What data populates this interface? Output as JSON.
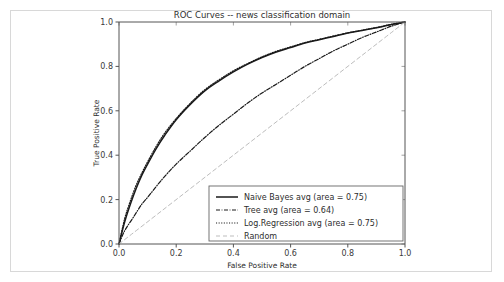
{
  "chart_data": {
    "type": "line",
    "title": "ROC Curves -- news classification domain",
    "xlabel": "False Positive Rate",
    "ylabel": "True Positive Rate",
    "xlim": [
      0.0,
      1.0
    ],
    "ylim": [
      0.0,
      1.0
    ],
    "grid": false,
    "legend_position": "lower right",
    "xticks": [
      "0.0",
      "0.2",
      "0.4",
      "0.6",
      "0.8",
      "1.0"
    ],
    "xtick_values": [
      0.0,
      0.2,
      0.4,
      0.6,
      0.8,
      1.0
    ],
    "yticks": [
      "0.0",
      "0.2",
      "0.4",
      "0.6",
      "0.8",
      "1.0"
    ],
    "ytick_values": [
      0.0,
      0.2,
      0.4,
      0.6,
      0.8,
      1.0
    ],
    "series": [
      {
        "name": "Naive Bayes avg (area = 0.75)",
        "label": "Naive Bayes avg (area = 0.75)",
        "area": 0.75,
        "style": "solid",
        "color": "#1a1a1a",
        "x": [
          0.0,
          0.02,
          0.04,
          0.06,
          0.08,
          0.1,
          0.13,
          0.16,
          0.2,
          0.25,
          0.3,
          0.35,
          0.4,
          0.45,
          0.5,
          0.55,
          0.6,
          0.65,
          0.7,
          0.75,
          0.8,
          0.85,
          0.9,
          0.95,
          1.0
        ],
        "y": [
          0.0,
          0.1,
          0.18,
          0.25,
          0.31,
          0.36,
          0.43,
          0.49,
          0.56,
          0.63,
          0.69,
          0.735,
          0.775,
          0.81,
          0.84,
          0.865,
          0.885,
          0.905,
          0.92,
          0.935,
          0.95,
          0.962,
          0.974,
          0.988,
          1.0
        ]
      },
      {
        "name": "Tree avg (area = 0.64)",
        "label": "Tree avg (area = 0.64)",
        "area": 0.64,
        "style": "dashdot",
        "color": "#1a1a1a",
        "x": [
          0.0,
          0.02,
          0.05,
          0.08,
          0.1,
          0.15,
          0.2,
          0.25,
          0.3,
          0.35,
          0.4,
          0.45,
          0.5,
          0.55,
          0.6,
          0.65,
          0.7,
          0.75,
          0.8,
          0.85,
          0.9,
          0.95,
          1.0
        ],
        "y": [
          0.0,
          0.06,
          0.12,
          0.18,
          0.21,
          0.29,
          0.36,
          0.42,
          0.48,
          0.535,
          0.585,
          0.635,
          0.68,
          0.72,
          0.76,
          0.8,
          0.835,
          0.87,
          0.9,
          0.93,
          0.955,
          0.98,
          1.0
        ]
      },
      {
        "name": "Log.Regression avg (area = 0.75)",
        "label": "Log.Regression avg (area = 0.75)",
        "area": 0.75,
        "style": "dotted-marker",
        "color": "#1a1a1a",
        "x": [
          0.0,
          0.02,
          0.04,
          0.06,
          0.08,
          0.1,
          0.13,
          0.16,
          0.2,
          0.25,
          0.3,
          0.35,
          0.4,
          0.45,
          0.5,
          0.55,
          0.6,
          0.65,
          0.7,
          0.75,
          0.8,
          0.85,
          0.9,
          0.95,
          1.0
        ],
        "y": [
          0.0,
          0.115,
          0.195,
          0.265,
          0.32,
          0.37,
          0.44,
          0.5,
          0.565,
          0.635,
          0.695,
          0.74,
          0.78,
          0.813,
          0.843,
          0.868,
          0.888,
          0.907,
          0.922,
          0.937,
          0.951,
          0.963,
          0.975,
          0.989,
          1.0
        ]
      },
      {
        "name": "Random",
        "label": "Random",
        "style": "dashed",
        "color": "#bdbdbd",
        "x": [
          0.0,
          1.0
        ],
        "y": [
          0.0,
          1.0
        ]
      }
    ]
  }
}
